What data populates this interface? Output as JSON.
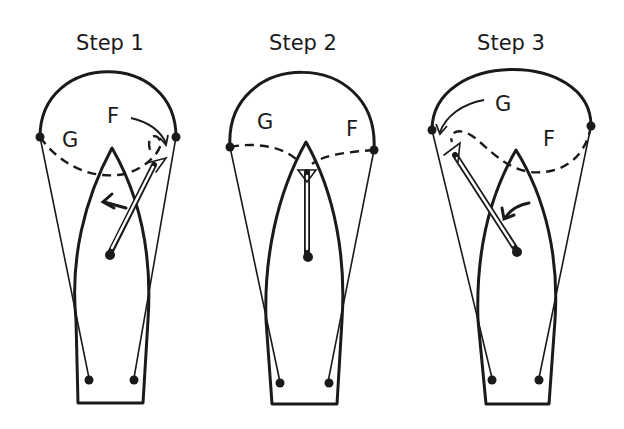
{
  "figure": {
    "panels": [
      {
        "title": "Step 1",
        "labels": {
          "guy": "G",
          "foreguy": "F"
        }
      },
      {
        "title": "Step 2",
        "labels": {
          "guy": "G",
          "foreguy": "F"
        }
      },
      {
        "title": "Step 3",
        "labels": {
          "guy": "G",
          "foreguy": "F"
        }
      }
    ],
    "colors": {
      "ink": "#1a1a1a",
      "background": "#ffffff"
    }
  }
}
